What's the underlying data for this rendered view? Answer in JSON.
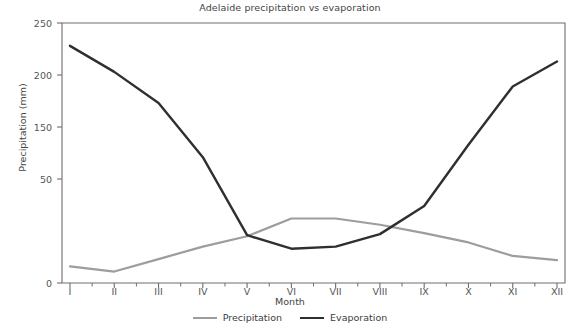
{
  "chart_data": {
    "type": "line",
    "title": "Adelaide precipitation vs evaporation",
    "xlabel": "Month",
    "ylabel": "Precipitation (mm)",
    "categories": [
      "I",
      "II",
      "III",
      "IV",
      "V",
      "VI",
      "VII",
      "VIII",
      "IX",
      "X",
      "XI",
      "XII"
    ],
    "ytick_labels": [
      "250",
      "200",
      "150",
      "50",
      "0"
    ],
    "ytick_values": [
      250,
      200,
      150,
      100,
      0
    ],
    "ylim": [
      0,
      250
    ],
    "grid": false,
    "legend_position": "bottom",
    "series": [
      {
        "name": "Precipitation",
        "color": "#9d9d9d",
        "values": [
          16,
          11,
          23,
          35,
          45,
          62,
          62,
          56,
          48,
          39,
          26,
          22
        ]
      },
      {
        "name": "Evaporation",
        "color": "#2f2f2f",
        "values": [
          228,
          203,
          173,
          121,
          46,
          33,
          35,
          47,
          74,
          133,
          189,
          213
        ]
      }
    ]
  },
  "axes": {
    "frame_color": "#6e6e6e",
    "tick_color": "#6e6e6e"
  }
}
